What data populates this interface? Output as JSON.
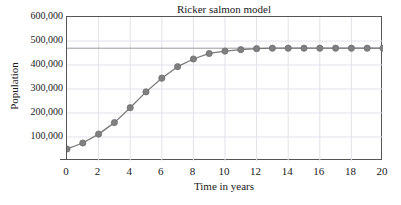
{
  "chart_data": {
    "type": "line",
    "title": "Ricker salmon model",
    "xlabel": "Time in years",
    "ylabel": "Population",
    "x": [
      0,
      1,
      2,
      3,
      4,
      5,
      6,
      7,
      8,
      9,
      10,
      11,
      12,
      13,
      14,
      15,
      16,
      17,
      18,
      19,
      20
    ],
    "values": [
      50000,
      75000,
      112000,
      160000,
      222000,
      288000,
      345000,
      393000,
      425000,
      448000,
      458000,
      464000,
      468000,
      470000,
      470000,
      470000,
      470000,
      470000,
      470000,
      470000,
      470000
    ],
    "series": [
      {
        "name": "Population",
        "values": [
          50000,
          75000,
          112000,
          160000,
          222000,
          288000,
          345000,
          393000,
          425000,
          448000,
          458000,
          464000,
          468000,
          470000,
          470000,
          470000,
          470000,
          470000,
          470000,
          470000,
          470000
        ]
      }
    ],
    "xlim": [
      0,
      20
    ],
    "ylim": [
      0,
      600000
    ],
    "xticks": [
      0,
      2,
      4,
      6,
      8,
      10,
      12,
      14,
      16,
      18,
      20
    ],
    "xtick_labels": [
      "0",
      "2",
      "4",
      "6",
      "8",
      "10",
      "12",
      "14",
      "16",
      "18",
      "20"
    ],
    "yticks": [
      100000,
      200000,
      300000,
      400000,
      500000,
      600000
    ],
    "ytick_labels": [
      "100,000",
      "200,000",
      "300,000",
      "400,000",
      "500,000",
      "600,000"
    ],
    "grid": true,
    "legend": null,
    "annotations": [
      {
        "type": "horizontal-asymptote",
        "value": 470000,
        "label": ""
      }
    ],
    "marker": "circle",
    "colors": {
      "line": "#7a7a7a",
      "marker": "#808080",
      "marker_edge": "#6e6e6e",
      "asymptote": "#9a9a9a",
      "grid": "#e2e2ea",
      "axis": "#555555",
      "text": "#1a1a1a"
    }
  }
}
